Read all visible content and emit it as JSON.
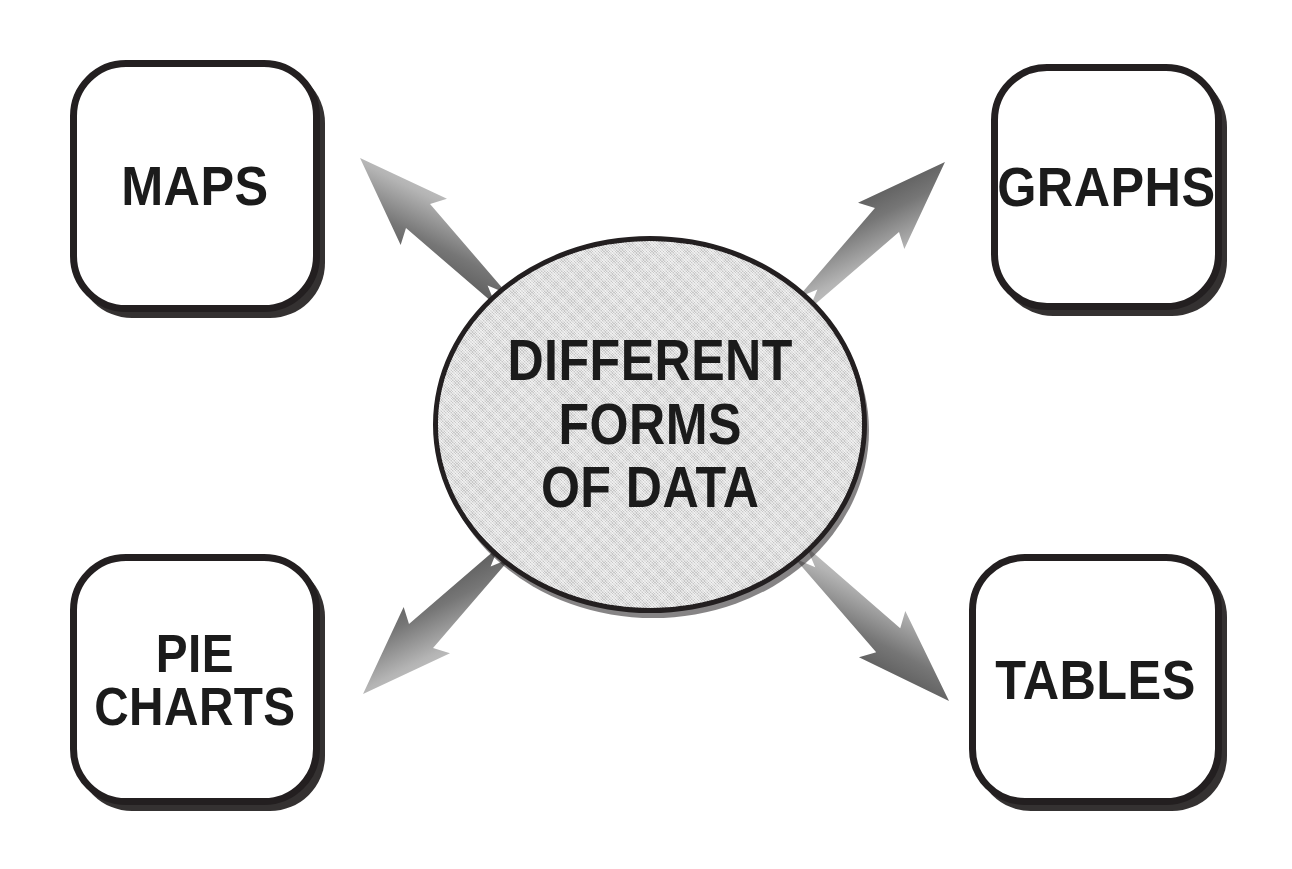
{
  "diagram": {
    "title": "Different Forms of Data",
    "background_color": "#ffffff",
    "type": "radial-hub-and-spoke",
    "hub": {
      "label": "DIFFERENT\nFORMS\nOF DATA",
      "lines": [
        "DIFFERENT",
        "FORMS",
        "OF DATA"
      ],
      "shape": "ellipse",
      "fill_color": "#dddddd",
      "border_color": "#231f20",
      "text_color": "#1b1b1b"
    },
    "nodes": [
      {
        "id": "maps",
        "label": "MAPS",
        "lines": [
          "MAPS"
        ],
        "position": "top-left",
        "shape": "rounded-rectangle",
        "fill_color": "#ffffff",
        "border_color": "#231f20",
        "text_color": "#1b1b1b"
      },
      {
        "id": "graphs",
        "label": "GRAPHS",
        "lines": [
          "GRAPHS"
        ],
        "position": "top-right",
        "shape": "rounded-rectangle",
        "fill_color": "#ffffff",
        "border_color": "#231f20",
        "text_color": "#1b1b1b"
      },
      {
        "id": "pie-charts",
        "label": "PIE\nCHARTS",
        "lines": [
          "PIE",
          "CHARTS"
        ],
        "position": "bottom-left",
        "shape": "rounded-rectangle",
        "fill_color": "#ffffff",
        "border_color": "#231f20",
        "text_color": "#1b1b1b"
      },
      {
        "id": "tables",
        "label": "TABLES",
        "lines": [
          "TABLES"
        ],
        "position": "bottom-right",
        "shape": "rounded-rectangle",
        "fill_color": "#ffffff",
        "border_color": "#231f20",
        "text_color": "#1b1b1b"
      }
    ],
    "arrows": [
      {
        "id": "arrow-hub-to-maps",
        "from": "hub",
        "to": "maps",
        "direction": "up-left",
        "style": "swallowtail-wedge",
        "gradient_from": "#c9c9c9",
        "gradient_to": "#4f4f4f"
      },
      {
        "id": "arrow-hub-to-graphs",
        "from": "hub",
        "to": "graphs",
        "direction": "up-right",
        "style": "swallowtail-wedge",
        "gradient_from": "#c9c9c9",
        "gradient_to": "#4f4f4f"
      },
      {
        "id": "arrow-hub-to-pie",
        "from": "hub",
        "to": "pie-charts",
        "direction": "down-left",
        "style": "swallowtail-wedge",
        "gradient_from": "#c9c9c9",
        "gradient_to": "#4f4f4f"
      },
      {
        "id": "arrow-hub-to-tables",
        "from": "hub",
        "to": "tables",
        "direction": "down-right",
        "style": "swallowtail-wedge",
        "gradient_from": "#c9c9c9",
        "gradient_to": "#4f4f4f"
      }
    ]
  }
}
